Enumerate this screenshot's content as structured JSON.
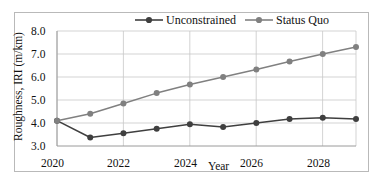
{
  "chart_data": {
    "type": "line",
    "title": "",
    "xlabel": "Year",
    "ylabel": "Roughness, IRI (m/km)",
    "x": [
      2020,
      2021,
      2022,
      2023,
      2024,
      2025,
      2026,
      2027,
      2028,
      2029
    ],
    "xlim": [
      2020,
      2029
    ],
    "ylim": [
      3.0,
      8.0
    ],
    "xticks": [
      2020,
      2022,
      2024,
      2026,
      2028
    ],
    "xtick_labels": [
      "2020",
      "2022",
      "2024",
      "2026",
      "2028"
    ],
    "yticks": [
      3.0,
      4.0,
      5.0,
      6.0,
      7.0,
      8.0
    ],
    "ytick_labels": [
      "3.0",
      "4.0",
      "5.0",
      "6.0",
      "7.0",
      "8.0"
    ],
    "grid": "horizontal-and-vertical",
    "legend_position": "top-center",
    "series": [
      {
        "name": "Unconstrained",
        "color": "#3f3f3f",
        "marker": "circle",
        "values": [
          4.1,
          3.37,
          3.55,
          3.75,
          3.95,
          3.83,
          4.0,
          4.17,
          4.23,
          4.17
        ]
      },
      {
        "name": "Status Quo",
        "color": "#808080",
        "marker": "circle",
        "values": [
          4.1,
          4.4,
          4.85,
          5.3,
          5.67,
          6.0,
          6.33,
          6.67,
          7.0,
          7.3
        ]
      }
    ]
  },
  "legend": {
    "items": [
      {
        "label": "Unconstrained",
        "color": "#3f3f3f"
      },
      {
        "label": "Status Quo",
        "color": "#808080"
      }
    ]
  },
  "axes": {
    "y_title": "Roughness, IRI (m/km)",
    "x_title": "Year",
    "y_ticks": [
      "8.0",
      "7.0",
      "6.0",
      "5.0",
      "4.0",
      "3.0"
    ],
    "x_ticks": [
      "2020",
      "2022",
      "2024",
      "2026",
      "2028"
    ]
  },
  "colors": {
    "unconstrained": "#3f3f3f",
    "status_quo": "#808080",
    "grid": "#c8c8c8",
    "axis": "#9a9a9a",
    "frame": "#b9b9b9",
    "background": "#ffffff"
  }
}
